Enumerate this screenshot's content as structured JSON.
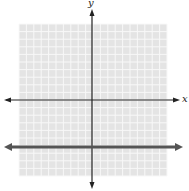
{
  "chart_data": {
    "type": "line",
    "title": "",
    "xlabel": "x",
    "ylabel": "y",
    "xlim": [
      -10,
      10
    ],
    "ylim": [
      -10,
      10
    ],
    "grid": true,
    "series": [
      {
        "name": "y = -6",
        "equation": "y = -6",
        "x": [
          -10,
          10
        ],
        "values": [
          -6,
          -6
        ]
      }
    ]
  },
  "axes": {
    "x_label": "x",
    "y_label": "y"
  },
  "colors": {
    "grid_bg": "#e6e6e6",
    "grid_line": "#f7f7f7",
    "axis": "#222222",
    "line": "#555555"
  }
}
